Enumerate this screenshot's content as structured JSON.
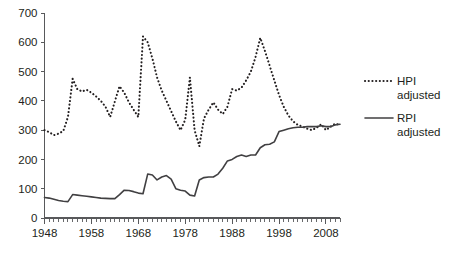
{
  "chart_data": {
    "type": "line",
    "title": "",
    "subtitle": "",
    "xlabel": "",
    "ylabel": "",
    "xlim": [
      1948,
      2011
    ],
    "ylim": [
      0,
      700
    ],
    "grid": false,
    "legend_position": "right",
    "y_ticks": [
      0,
      100,
      200,
      300,
      400,
      500,
      600,
      700
    ],
    "y_tick_labels": [
      "0",
      "100",
      "200",
      "300",
      "400",
      "500",
      "600",
      "700"
    ],
    "x_ticks": [
      1948,
      1958,
      1968,
      1978,
      1988,
      1998,
      2008
    ],
    "x_tick_labels": [
      "1948",
      "1958",
      "1968",
      "1978",
      "1988",
      "1998",
      "2008"
    ],
    "x_minor_tick_step": 1,
    "x": [
      1948,
      1949,
      1950,
      1951,
      1952,
      1953,
      1954,
      1955,
      1956,
      1957,
      1958,
      1959,
      1960,
      1961,
      1962,
      1963,
      1964,
      1965,
      1966,
      1967,
      1968,
      1969,
      1970,
      1971,
      1972,
      1973,
      1974,
      1975,
      1976,
      1977,
      1978,
      1979,
      1980,
      1981,
      1982,
      1983,
      1984,
      1985,
      1986,
      1987,
      1988,
      1989,
      1990,
      1991,
      1992,
      1993,
      1994,
      1995,
      1996,
      1997,
      1998,
      1999,
      2000,
      2001,
      2002,
      2003,
      2004,
      2005,
      2006,
      2007,
      2008,
      2009,
      2010,
      2011
    ],
    "series": [
      {
        "name": "HPI adjusted",
        "style": "dotted",
        "color": "#231f20",
        "values": [
          300,
          293,
          283,
          288,
          297,
          345,
          475,
          440,
          432,
          438,
          428,
          415,
          400,
          380,
          345,
          398,
          450,
          428,
          395,
          370,
          345,
          620,
          600,
          545,
          480,
          435,
          400,
          365,
          330,
          300,
          335,
          480,
          300,
          245,
          340,
          370,
          395,
          370,
          355,
          380,
          440,
          435,
          445,
          470,
          500,
          550,
          615,
          570,
          520,
          470,
          420,
          380,
          350,
          330,
          318,
          312,
          305,
          300,
          308,
          320,
          300,
          312,
          322,
          318
        ]
      },
      {
        "name": "RPI adjusted",
        "style": "solid",
        "color": "#414042",
        "values": [
          70,
          68,
          64,
          60,
          57,
          56,
          80,
          78,
          76,
          74,
          72,
          70,
          68,
          67,
          66,
          66,
          80,
          95,
          94,
          90,
          85,
          83,
          150,
          147,
          130,
          140,
          145,
          133,
          100,
          95,
          92,
          78,
          75,
          130,
          138,
          140,
          140,
          150,
          170,
          195,
          200,
          210,
          215,
          210,
          215,
          215,
          240,
          250,
          252,
          260,
          295,
          300,
          305,
          308,
          310,
          310,
          312,
          312,
          312,
          315,
          312,
          312,
          318,
          320
        ]
      }
    ]
  },
  "legend": {
    "items": [
      {
        "label_line1": "HPI",
        "label_line2": "adjusted",
        "style": "dotted"
      },
      {
        "label_line1": "RPI",
        "label_line2": "adjusted",
        "style": "solid"
      }
    ]
  }
}
